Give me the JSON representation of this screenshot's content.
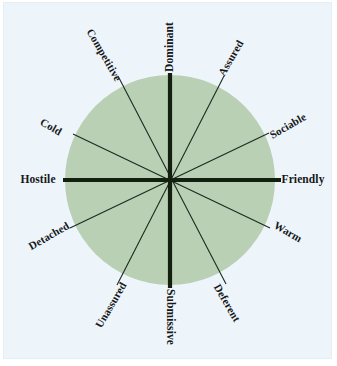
{
  "figure": {
    "type": "interpersonal-circumplex",
    "title": "",
    "canvas": {
      "width": 337,
      "height": 366
    },
    "plate": {
      "background": "#eef5fa",
      "border": "#e4eef6"
    },
    "circle": {
      "center_x": 170,
      "center_y": 180,
      "radius": 105,
      "fill": "#b9d0b5",
      "stroke": "none"
    },
    "line_color": "#1b2a1e",
    "major_axis_width": 4,
    "minor_axis_width": 1.1
  },
  "chart_data": {
    "type": "radial",
    "axes": [
      {
        "name": "dominance",
        "poles": [
          "Dominant",
          "Submissive"
        ],
        "emphasis": "major",
        "angle_deg": 90
      },
      {
        "name": "affiliation",
        "poles": [
          "Hostile",
          "Friendly"
        ],
        "emphasis": "major",
        "angle_deg": 0
      }
    ],
    "octants": [
      {
        "label": "Dominant",
        "angle_deg": 90,
        "emphasis": "major"
      },
      {
        "label": "Assured",
        "angle_deg": 60,
        "emphasis": "minor"
      },
      {
        "label": "Sociable",
        "angle_deg": 30,
        "emphasis": "minor"
      },
      {
        "label": "Friendly",
        "angle_deg": 0,
        "emphasis": "major"
      },
      {
        "label": "Warm",
        "angle_deg": 330,
        "emphasis": "minor"
      },
      {
        "label": "Deferent",
        "angle_deg": 300,
        "emphasis": "minor"
      },
      {
        "label": "Submissive",
        "angle_deg": 270,
        "emphasis": "major"
      },
      {
        "label": "Unassured",
        "angle_deg": 240,
        "emphasis": "minor"
      },
      {
        "label": "Detached",
        "angle_deg": 210,
        "emphasis": "minor"
      },
      {
        "label": "Hostile",
        "angle_deg": 180,
        "emphasis": "major"
      },
      {
        "label": "Cold",
        "angle_deg": 150,
        "emphasis": "minor"
      },
      {
        "label": "Competitive",
        "angle_deg": 120,
        "emphasis": "minor"
      }
    ]
  },
  "labels": {
    "dominant": {
      "text": "Dominant",
      "x": 170,
      "y": 47,
      "rotate": -90,
      "pole": true
    },
    "assured": {
      "text": "Assured",
      "x": 231,
      "y": 58,
      "rotate": -60,
      "pole": false
    },
    "sociable": {
      "text": "Sociable",
      "x": 288,
      "y": 126,
      "rotate": -30,
      "pole": false
    },
    "friendly": {
      "text": "Friendly",
      "x": 303,
      "y": 180,
      "rotate": 0,
      "pole": true
    },
    "warm": {
      "text": "Warm",
      "x": 288,
      "y": 232,
      "rotate": 30,
      "pole": false
    },
    "deferent": {
      "text": "Deferent",
      "x": 227,
      "y": 303,
      "rotate": 60,
      "pole": false
    },
    "submissive": {
      "text": "Submissive",
      "x": 170,
      "y": 317,
      "rotate": 90,
      "pole": true
    },
    "unassured": {
      "text": "Unassured",
      "x": 111,
      "y": 305,
      "rotate": -60,
      "pole": false
    },
    "detached": {
      "text": "Detached",
      "x": 49,
      "y": 236,
      "rotate": -30,
      "pole": false
    },
    "hostile": {
      "text": "Hostile",
      "x": 38,
      "y": 180,
      "rotate": 0,
      "pole": true
    },
    "cold": {
      "text": "Cold",
      "x": 51,
      "y": 127,
      "rotate": 30,
      "pole": false
    },
    "competitive": {
      "text": "Competitive",
      "x": 104,
      "y": 55,
      "rotate": 60,
      "pole": false
    }
  }
}
